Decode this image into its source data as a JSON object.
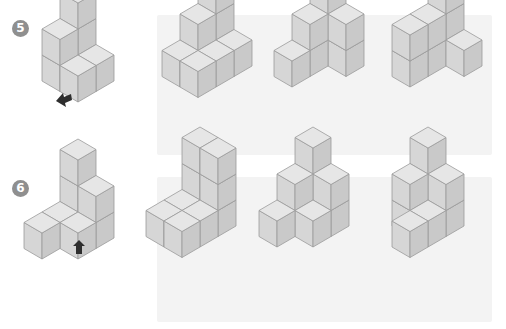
{
  "problems": [
    {
      "number": "5",
      "badge": {
        "x": 12,
        "y": 20
      },
      "panel": {
        "x": 157,
        "y": 15,
        "w": 335,
        "h": 140
      },
      "reference": {
        "origin": [
          78,
          60
        ],
        "cubes": [
          [
            0,
            0,
            0
          ],
          [
            0,
            0,
            1
          ],
          [
            0,
            0,
            2
          ],
          [
            1,
            0,
            0
          ],
          [
            0,
            1,
            0
          ],
          [
            0,
            1,
            1
          ],
          [
            1,
            1,
            0
          ]
        ],
        "arrow": {
          "direction": "left-up",
          "cx": 64,
          "cy": 98
        }
      },
      "options": [
        {
          "label": "option-1",
          "origin": [
            216,
            45
          ],
          "cubes": [
            [
              0,
              0,
              0
            ],
            [
              0,
              0,
              1
            ],
            [
              0,
              0,
              2
            ],
            [
              0,
              1,
              0
            ],
            [
              0,
              1,
              1
            ],
            [
              1,
              0,
              0
            ],
            [
              1,
              1,
              0
            ],
            [
              0,
              2,
              0
            ],
            [
              1,
              2,
              0
            ]
          ]
        },
        {
          "label": "option-2",
          "origin": [
            328,
            45
          ],
          "cubes": [
            [
              0,
              0,
              0
            ],
            [
              0,
              0,
              1
            ],
            [
              0,
              0,
              2
            ],
            [
              1,
              0,
              0
            ],
            [
              1,
              0,
              1
            ],
            [
              0,
              1,
              0
            ],
            [
              0,
              1,
              1
            ],
            [
              0,
              2,
              0
            ]
          ]
        },
        {
          "label": "option-3",
          "origin": [
            446,
            45
          ],
          "cubes": [
            [
              0,
              0,
              0
            ],
            [
              0,
              0,
              1
            ],
            [
              0,
              0,
              2
            ],
            [
              0,
              1,
              0
            ],
            [
              0,
              1,
              1
            ],
            [
              1,
              0,
              0
            ],
            [
              0,
              2,
              0
            ],
            [
              0,
              2,
              1
            ]
          ]
        }
      ]
    },
    {
      "number": "6",
      "badge": {
        "x": 12,
        "y": 180
      },
      "panel": {
        "x": 157,
        "y": 177,
        "w": 335,
        "h": 145
      },
      "reference": {
        "origin": [
          78,
          217
        ],
        "cubes": [
          [
            0,
            0,
            0
          ],
          [
            0,
            0,
            1
          ],
          [
            0,
            0,
            2
          ],
          [
            1,
            0,
            0
          ],
          [
            1,
            0,
            1
          ],
          [
            0,
            1,
            0
          ],
          [
            1,
            1,
            0
          ],
          [
            0,
            2,
            0
          ]
        ],
        "arrow": {
          "direction": "up",
          "cx": 79,
          "cy": 248
        }
      },
      "options": [
        {
          "label": "option-1",
          "origin": [
            200,
            205
          ],
          "cubes": [
            [
              0,
              0,
              0
            ],
            [
              0,
              0,
              1
            ],
            [
              0,
              0,
              2
            ],
            [
              1,
              0,
              0
            ],
            [
              1,
              0,
              1
            ],
            [
              1,
              0,
              2
            ],
            [
              0,
              1,
              0
            ],
            [
              1,
              1,
              0
            ],
            [
              0,
              2,
              0
            ],
            [
              1,
              2,
              0
            ]
          ]
        },
        {
          "label": "option-2",
          "origin": [
            313,
            205
          ],
          "cubes": [
            [
              0,
              0,
              0
            ],
            [
              0,
              0,
              1
            ],
            [
              0,
              0,
              2
            ],
            [
              1,
              0,
              0
            ],
            [
              1,
              0,
              1
            ],
            [
              0,
              1,
              0
            ],
            [
              0,
              1,
              1
            ],
            [
              1,
              1,
              0
            ],
            [
              0,
              2,
              0
            ]
          ]
        },
        {
          "label": "option-3",
          "origin": [
            428,
            205
          ],
          "cubes": [
            [
              0,
              0,
              0
            ],
            [
              0,
              0,
              1
            ],
            [
              0,
              0,
              2
            ],
            [
              1,
              0,
              0
            ],
            [
              1,
              0,
              1
            ],
            [
              0,
              1,
              0
            ],
            [
              0,
              1,
              1
            ],
            [
              1,
              1,
              0
            ],
            [
              1,
              2,
              0
            ]
          ]
        }
      ]
    }
  ],
  "colors": {
    "top": "#e6e6e6",
    "left": "#d6d6d6",
    "right": "#c9c9c9",
    "edge": "#9a9a9a",
    "panel": "#f3f3f3",
    "badge": "#8f8f8f",
    "arrow": "#2e2e2e"
  }
}
